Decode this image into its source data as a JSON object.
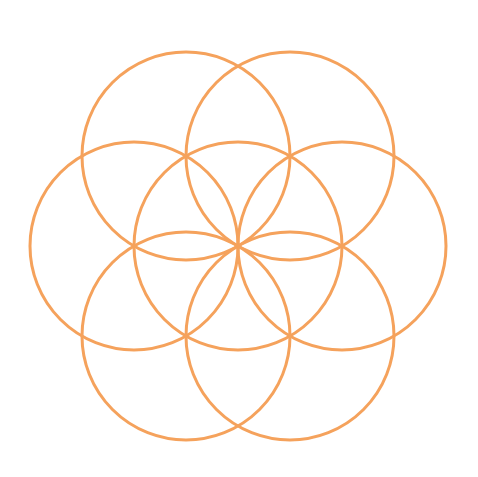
{
  "diagram": {
    "type": "geometric-pattern",
    "background": "#ffffff",
    "stroke_color": "#F5A25C",
    "stroke_width": 3,
    "center": {
      "x": 238,
      "y": 246
    },
    "radius": 104,
    "circles": [
      {
        "name": "center-circle",
        "cx": 238,
        "cy": 246
      },
      {
        "name": "right-circle",
        "cx": 342,
        "cy": 246
      },
      {
        "name": "left-circle",
        "cx": 134,
        "cy": 246
      },
      {
        "name": "top-right-circle",
        "cx": 290,
        "cy": 156
      },
      {
        "name": "top-left-circle",
        "cx": 186,
        "cy": 156
      },
      {
        "name": "bottom-right-circle",
        "cx": 290,
        "cy": 336
      },
      {
        "name": "bottom-left-circle",
        "cx": 186,
        "cy": 336
      }
    ]
  }
}
